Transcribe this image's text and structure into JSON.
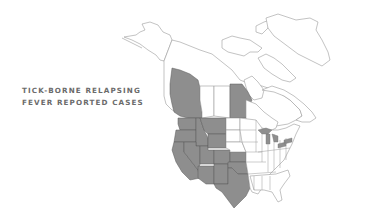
{
  "title": {
    "line1": "TICK-BORNE RELAPSING",
    "line2": "FEVER REPORTED CASES"
  },
  "map": {
    "region": "North America",
    "colors": {
      "background": "#ffffff",
      "outline": "#9a9a9a",
      "reported": "#8e8e8e",
      "reported_border": "#5a5a5a",
      "title_text": "#6b6b6b"
    },
    "reported_regions": [
      "British Columbia",
      "Manitoba",
      "Washington",
      "Oregon",
      "California",
      "Idaho",
      "Nevada",
      "Utah",
      "Arizona",
      "Montana",
      "Wyoming",
      "Colorado",
      "New Mexico",
      "Kansas",
      "Oklahoma",
      "Texas"
    ]
  }
}
